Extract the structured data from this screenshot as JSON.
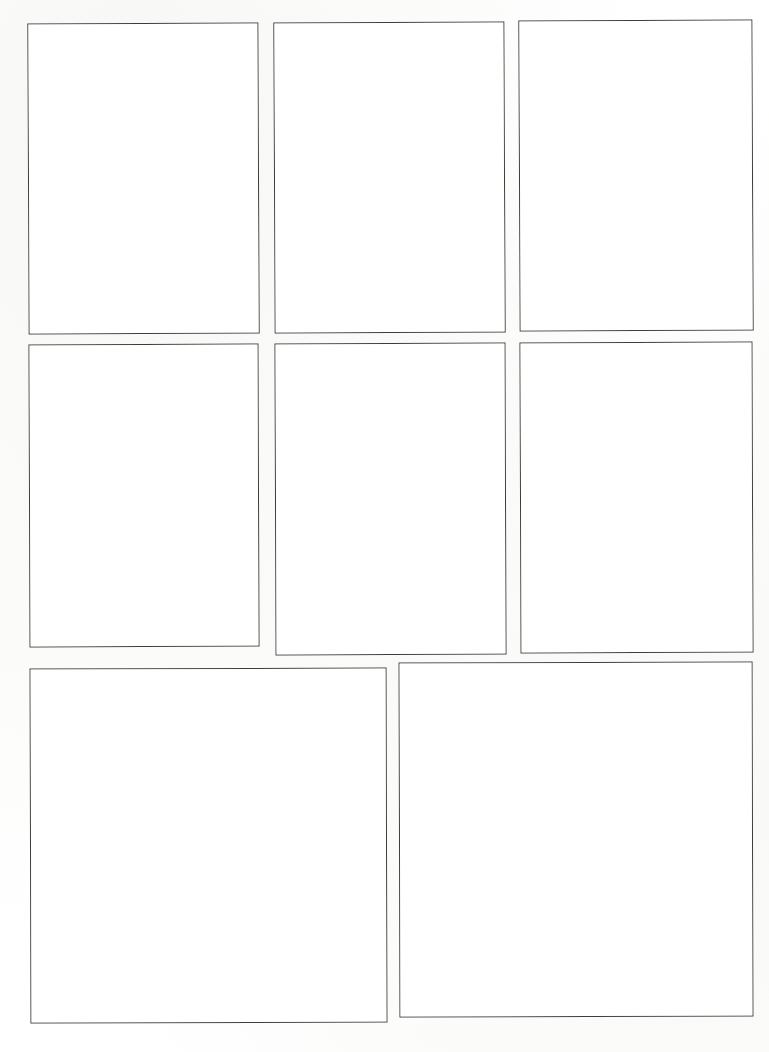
{
  "page": {
    "kind": "comic-page-layout",
    "width": 769,
    "height": 1052,
    "background_color": "#fefefe",
    "paper_color": "#ffffff",
    "border_color": "#3c3c3c",
    "border_width_px": 1,
    "row_count": 3,
    "panel_count": 8,
    "content": ""
  },
  "rows": [
    {
      "name": "row-1",
      "panel_count": 3
    },
    {
      "name": "row-2",
      "panel_count": 3
    },
    {
      "name": "row-3",
      "panel_count": 2
    }
  ],
  "panels": [
    {
      "id": "panel-1",
      "row": 1,
      "column": 1,
      "label": "",
      "x": 28,
      "y": 23,
      "width": 231,
      "height": 311,
      "skew_deg": -0.25
    },
    {
      "id": "panel-2",
      "row": 1,
      "column": 2,
      "label": "",
      "x": 274,
      "y": 22,
      "width": 231,
      "height": 311,
      "skew_deg": -0.25
    },
    {
      "id": "panel-3",
      "row": 1,
      "column": 3,
      "label": "",
      "x": 519,
      "y": 20,
      "width": 234,
      "height": 311,
      "skew_deg": -0.25
    },
    {
      "id": "panel-4",
      "row": 2,
      "column": 1,
      "label": "",
      "x": 29,
      "y": 344,
      "width": 230,
      "height": 303,
      "skew_deg": -0.2
    },
    {
      "id": "panel-5",
      "row": 2,
      "column": 2,
      "label": "",
      "x": 275,
      "y": 343,
      "width": 231,
      "height": 312,
      "skew_deg": -0.2
    },
    {
      "id": "panel-6",
      "row": 2,
      "column": 3,
      "label": "",
      "x": 520,
      "y": 342,
      "width": 233,
      "height": 311,
      "skew_deg": -0.2
    },
    {
      "id": "panel-7",
      "row": 3,
      "column": 1,
      "label": "",
      "x": 30,
      "y": 668,
      "width": 357,
      "height": 355,
      "skew_deg": -0.15
    },
    {
      "id": "panel-8",
      "row": 3,
      "column": 2,
      "label": "",
      "x": 399,
      "y": 662,
      "width": 354,
      "height": 355,
      "skew_deg": -0.15
    }
  ]
}
